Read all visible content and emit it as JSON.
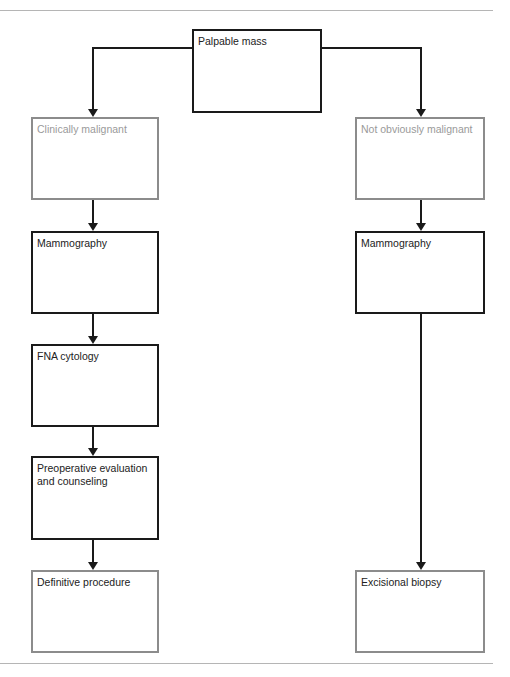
{
  "diagram": {
    "type": "flowchart",
    "nodes": {
      "root": {
        "label": "Palpable mass"
      },
      "left_1": {
        "label": "Clinically malignant"
      },
      "left_2": {
        "label": "Mammography"
      },
      "left_3": {
        "label": "FNA cytology"
      },
      "left_4": {
        "label": "Preoperative evaluation and counseling"
      },
      "left_5": {
        "label": "Definitive procedure"
      },
      "right_1": {
        "label": "Not obviously malignant"
      },
      "right_2": {
        "label": "Mammography"
      },
      "right_3": {
        "label": "Excisional biopsy"
      }
    },
    "edges": [
      [
        "Palpable mass",
        "Clinically malignant"
      ],
      [
        "Palpable mass",
        "Not obviously malignant"
      ],
      [
        "Clinically malignant",
        "Mammography"
      ],
      [
        "Mammography",
        "FNA cytology"
      ],
      [
        "FNA cytology",
        "Preoperative evaluation and counseling"
      ],
      [
        "Preoperative evaluation and counseling",
        "Definitive procedure"
      ],
      [
        "Not obviously malignant",
        "Mammography"
      ],
      [
        "Mammography",
        "Excisional biopsy"
      ]
    ],
    "colors": {
      "dark_border": "#1a1a1a",
      "gray_border": "#8c8c8c",
      "faint_text": "#9a9a9a"
    }
  }
}
